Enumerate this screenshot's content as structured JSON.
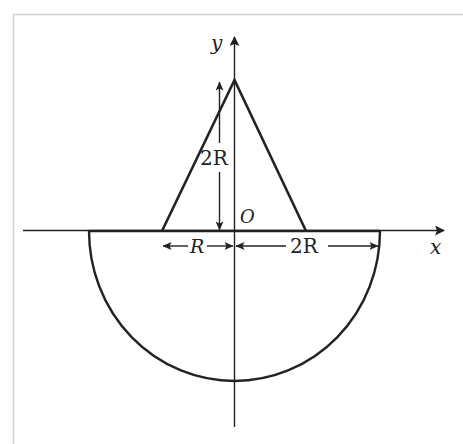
{
  "figure": {
    "colors": {
      "line": "#222222",
      "frame": "#d0d0d0",
      "background": "#ffffff"
    },
    "axes": {
      "x_label": "x",
      "y_label": "y",
      "origin_label": "O"
    },
    "dimensions": {
      "triangle_height": "2R",
      "triangle_half_base": "R",
      "semicircle_radius": "2R"
    },
    "shapes": [
      {
        "type": "triangle",
        "name": "isosceles-triangle",
        "apex": "(0, 2R)",
        "base": "from (-R, 0) to (R, 0)"
      },
      {
        "type": "semicircle",
        "name": "lower-semicircle",
        "center": "(0, 0)",
        "radius": "2R",
        "side": "below x-axis"
      }
    ]
  }
}
